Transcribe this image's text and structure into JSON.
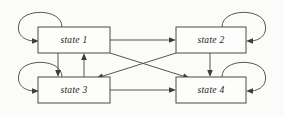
{
  "diagram": {
    "background_color": "#fbfbf9",
    "stroke_color": "#55544f",
    "box_fill_color": "#fdfdfc",
    "label_color": "#1a1a18",
    "states": [
      {
        "id": "state1",
        "label": "state 1",
        "x": 38,
        "y": 27,
        "width": 72,
        "height": 26,
        "self_loop_side": "left"
      },
      {
        "id": "state2",
        "label": "state 2",
        "x": 176,
        "y": 27,
        "width": 70,
        "height": 26,
        "self_loop_side": "right"
      },
      {
        "id": "state3",
        "label": "state 3",
        "x": 38,
        "y": 77,
        "width": 72,
        "height": 26,
        "self_loop_side": "left"
      },
      {
        "id": "state4",
        "label": "state 4",
        "x": 176,
        "y": 77,
        "width": 70,
        "height": 26,
        "self_loop_side": "right"
      }
    ],
    "transitions": [
      {
        "from": "state1",
        "to": "state1",
        "kind": "self-loop"
      },
      {
        "from": "state2",
        "to": "state2",
        "kind": "self-loop"
      },
      {
        "from": "state3",
        "to": "state3",
        "kind": "self-loop"
      },
      {
        "from": "state4",
        "to": "state4",
        "kind": "self-loop"
      },
      {
        "from": "state1",
        "to": "state2",
        "kind": "horizontal"
      },
      {
        "from": "state3",
        "to": "state4",
        "kind": "horizontal"
      },
      {
        "from": "state1",
        "to": "state3",
        "kind": "vertical"
      },
      {
        "from": "state3",
        "to": "state1",
        "kind": "vertical"
      },
      {
        "from": "state2",
        "to": "state4",
        "kind": "vertical"
      },
      {
        "from": "state1",
        "to": "state4",
        "kind": "diagonal"
      },
      {
        "from": "state2",
        "to": "state3",
        "kind": "diagonal"
      }
    ]
  }
}
